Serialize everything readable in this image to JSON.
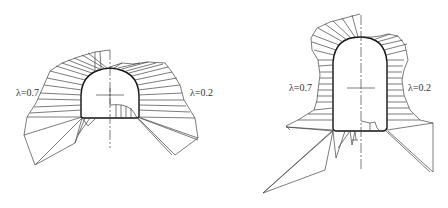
{
  "figure": {
    "left_panel": {
      "label_left": "λ=0.7",
      "label_right": "λ=0.2",
      "shape": "horseshoe-tunnel"
    },
    "right_panel": {
      "label_left": "λ=0.7",
      "label_right": "λ=0.2",
      "shape": "tall-arched-tunnel"
    },
    "colors": {
      "line": "#333333",
      "outline": "#111111",
      "background": "#ffffff"
    }
  }
}
